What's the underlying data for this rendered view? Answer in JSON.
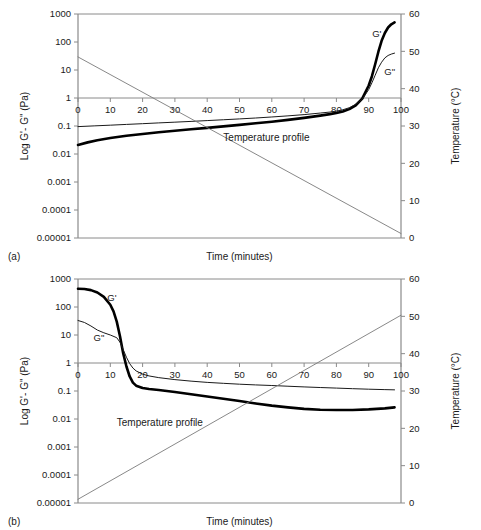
{
  "figure": {
    "panels": [
      {
        "key": "a",
        "panel_label": "(a)",
        "xlabel": "Time (minutes)",
        "ylabel_left": "Log G'- G\" (Pa)",
        "ylabel_right": "Temperature (°C)",
        "annotation": "Temperature profile",
        "series_labels": {
          "storage": "G'",
          "loss": "G\""
        }
      },
      {
        "key": "b",
        "panel_label": "(b)",
        "xlabel": "Time (minutes)",
        "ylabel_left": "Log G'- G\" (Pa)",
        "ylabel_right": "Temperature (°C)",
        "annotation": "Temperature profile",
        "series_labels": {
          "storage": "G'",
          "loss": "G\""
        }
      }
    ],
    "colors": {
      "storage_modulus": "#000000",
      "loss_modulus": "#1a1a1a",
      "temperature_profile": "#7a7a7a",
      "axis": "#8a8a8a",
      "text": "#1a1a1a"
    }
  },
  "chart_data": [
    {
      "type": "line",
      "id": "panel-a",
      "title": "(a)",
      "xlabel": "Time (minutes)",
      "ylabel": "Log G'- G\" (Pa)",
      "y2label": "Temperature (°C)",
      "xlim": [
        0,
        100
      ],
      "xticks": [
        0,
        10,
        20,
        30,
        40,
        50,
        60,
        70,
        80,
        90,
        100
      ],
      "yscale": "log",
      "ylim": [
        1e-05,
        1000
      ],
      "yticks": [
        1e-05,
        0.0001,
        0.001,
        0.01,
        0.1,
        1,
        10,
        100,
        1000
      ],
      "yticklabels": [
        "0.00001",
        "0.0001",
        "0.001",
        "0.01",
        "0.1",
        "1",
        "10",
        "100",
        "1000"
      ],
      "y2lim": [
        0,
        60
      ],
      "y2ticks": [
        0,
        10,
        20,
        30,
        40,
        50,
        60
      ],
      "grid": false,
      "legend": "inline-curve-labels",
      "annotations": [
        {
          "text": "Temperature profile",
          "x": 45,
          "y_pa": 0.028
        }
      ],
      "series": [
        {
          "name": "G'",
          "axis": "left",
          "style": "thick-black",
          "x": [
            0,
            3,
            6,
            10,
            15,
            20,
            25,
            30,
            35,
            40,
            45,
            50,
            55,
            60,
            65,
            70,
            75,
            78,
            80,
            82,
            84,
            86,
            88,
            90,
            91,
            92,
            93,
            94,
            95,
            96,
            97,
            98
          ],
          "values": [
            0.021,
            0.026,
            0.031,
            0.037,
            0.045,
            0.052,
            0.06,
            0.068,
            0.077,
            0.086,
            0.097,
            0.11,
            0.125,
            0.142,
            0.165,
            0.195,
            0.235,
            0.265,
            0.29,
            0.33,
            0.4,
            0.55,
            0.95,
            2.8,
            6.0,
            16,
            45,
            110,
            210,
            330,
            430,
            500
          ]
        },
        {
          "name": "G\"",
          "axis": "left",
          "style": "thin-black",
          "x": [
            0,
            5,
            10,
            15,
            20,
            25,
            30,
            35,
            40,
            45,
            50,
            55,
            60,
            65,
            70,
            75,
            78,
            80,
            82,
            84,
            86,
            88,
            90,
            91,
            92,
            93,
            94,
            95,
            96,
            97,
            98
          ],
          "values": [
            0.095,
            0.101,
            0.107,
            0.114,
            0.121,
            0.129,
            0.137,
            0.146,
            0.156,
            0.167,
            0.179,
            0.193,
            0.21,
            0.23,
            0.255,
            0.29,
            0.315,
            0.34,
            0.38,
            0.45,
            0.6,
            0.9,
            2.0,
            3.5,
            6.5,
            12,
            19,
            27,
            33,
            37,
            40
          ]
        },
        {
          "name": "Temperature profile",
          "axis": "right",
          "style": "thin-gray",
          "x": [
            0,
            100
          ],
          "values": [
            48.5,
            1.2
          ]
        }
      ]
    },
    {
      "type": "line",
      "id": "panel-b",
      "title": "(b)",
      "xlabel": "Time (minutes)",
      "ylabel": "Log G'- G\" (Pa)",
      "y2label": "Temperature (°C)",
      "xlim": [
        0,
        100
      ],
      "xticks": [
        0,
        10,
        20,
        30,
        40,
        50,
        60,
        70,
        80,
        90,
        100
      ],
      "yscale": "log",
      "ylim": [
        1e-05,
        1000
      ],
      "yticks": [
        1e-05,
        0.0001,
        0.001,
        0.01,
        0.1,
        1,
        10,
        100,
        1000
      ],
      "yticklabels": [
        "0.00001",
        "0.0001",
        "0.001",
        "0.01",
        "0.1",
        "1",
        "10",
        "100",
        "1000"
      ],
      "y2lim": [
        0,
        60
      ],
      "y2ticks": [
        0,
        10,
        20,
        30,
        40,
        50,
        60
      ],
      "grid": false,
      "legend": "inline-curve-labels",
      "annotations": [
        {
          "text": "Temperature profile",
          "x": 12,
          "y_pa": 0.0055
        }
      ],
      "series": [
        {
          "name": "G'",
          "axis": "left",
          "style": "thick-black",
          "x": [
            0,
            2,
            4,
            6,
            8,
            10,
            11,
            12,
            13,
            14,
            15,
            16,
            17,
            18,
            20,
            22,
            25,
            30,
            35,
            40,
            45,
            50,
            55,
            60,
            65,
            70,
            75,
            80,
            85,
            90,
            95,
            98
          ],
          "values": [
            450,
            440,
            400,
            330,
            230,
            120,
            70,
            30,
            9,
            2.2,
            0.75,
            0.33,
            0.2,
            0.155,
            0.128,
            0.118,
            0.108,
            0.092,
            0.077,
            0.064,
            0.053,
            0.044,
            0.036,
            0.03,
            0.026,
            0.023,
            0.0215,
            0.021,
            0.021,
            0.022,
            0.024,
            0.026
          ]
        },
        {
          "name": "G\"",
          "axis": "left",
          "style": "thin-black",
          "x": [
            0,
            2,
            4,
            6,
            8,
            10,
            12,
            13,
            14,
            15,
            16,
            17,
            18,
            20,
            22,
            25,
            30,
            35,
            40,
            45,
            50,
            55,
            60,
            65,
            70,
            75,
            80,
            85,
            90,
            95,
            98
          ],
          "values": [
            33,
            28,
            21,
            15,
            12,
            10,
            8.0,
            5.5,
            3.0,
            1.6,
            0.95,
            0.66,
            0.52,
            0.4,
            0.345,
            0.3,
            0.255,
            0.225,
            0.203,
            0.188,
            0.175,
            0.165,
            0.157,
            0.148,
            0.14,
            0.133,
            0.127,
            0.121,
            0.116,
            0.112,
            0.11
          ]
        },
        {
          "name": "Temperature profile",
          "axis": "right",
          "style": "thin-gray",
          "x": [
            0,
            100
          ],
          "values": [
            1.0,
            50.3
          ]
        }
      ]
    }
  ]
}
